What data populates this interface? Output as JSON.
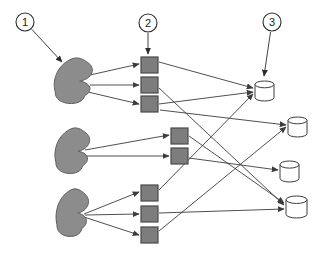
{
  "diagram": {
    "colors": {
      "source_fill": "#8c8c8c",
      "source_stroke": "#5e5e5e",
      "node_fill": "#7d7d7d",
      "node_stroke": "#4a4a4a",
      "store_fill": "#ffffff",
      "store_stroke": "#3c3c3c",
      "arrow": "#3c3c3c",
      "callout_stroke": "#2b2b2b",
      "background": "#ffffff"
    },
    "callouts": [
      {
        "id": "callout-1",
        "label": "1",
        "cx": 25,
        "cy": 22,
        "r": 9,
        "tip_x": 62,
        "tip_y": 62
      },
      {
        "id": "callout-2",
        "label": "2",
        "cx": 148,
        "cy": 23,
        "r": 9,
        "tip_x": 148,
        "tip_y": 54
      },
      {
        "id": "callout-3",
        "label": "3",
        "cx": 272,
        "cy": 22,
        "r": 9,
        "tip_x": 264,
        "tip_y": 76
      }
    ],
    "sources": [
      {
        "id": "source-1",
        "label": "source-blob-1",
        "cx": 73,
        "cy": 82,
        "w": 34,
        "h": 46
      },
      {
        "id": "source-2",
        "label": "source-blob-2",
        "cx": 72,
        "cy": 152,
        "w": 31,
        "h": 46
      },
      {
        "id": "source-3",
        "label": "source-blob-3",
        "cx": 72,
        "cy": 214,
        "w": 29,
        "h": 48
      }
    ],
    "nodes": [
      {
        "id": "node-1",
        "label": "node-1",
        "x": 141,
        "y": 57,
        "w": 17,
        "h": 16,
        "group": 1
      },
      {
        "id": "node-2",
        "label": "node-2",
        "x": 141,
        "y": 77,
        "w": 17,
        "h": 16,
        "group": 1
      },
      {
        "id": "node-3",
        "label": "node-3",
        "x": 141,
        "y": 96,
        "w": 17,
        "h": 16,
        "group": 1
      },
      {
        "id": "node-4",
        "label": "node-4",
        "x": 171,
        "y": 128,
        "w": 17,
        "h": 16,
        "group": 2
      },
      {
        "id": "node-5",
        "label": "node-5",
        "x": 171,
        "y": 148,
        "w": 17,
        "h": 16,
        "group": 2
      },
      {
        "id": "node-6",
        "label": "node-6",
        "x": 141,
        "y": 185,
        "w": 17,
        "h": 16,
        "group": 3
      },
      {
        "id": "node-7",
        "label": "node-7",
        "x": 141,
        "y": 206,
        "w": 17,
        "h": 16,
        "group": 3
      },
      {
        "id": "node-8",
        "label": "node-8",
        "x": 141,
        "y": 227,
        "w": 17,
        "h": 16,
        "group": 3
      }
    ],
    "stores": [
      {
        "id": "store-1",
        "label": "store-1",
        "x": 255,
        "y": 81,
        "w": 19,
        "h": 20
      },
      {
        "id": "store-2",
        "label": "store-2",
        "x": 288,
        "y": 117,
        "w": 19,
        "h": 20
      },
      {
        "id": "store-3",
        "label": "store-3",
        "x": 280,
        "y": 161,
        "w": 19,
        "h": 21
      },
      {
        "id": "store-4",
        "label": "store-4",
        "x": 286,
        "y": 196,
        "w": 21,
        "h": 22
      }
    ],
    "links_source_to_node": [
      {
        "from": "source-1",
        "to": "node-1",
        "x1": 90,
        "y1": 75,
        "x2": 139,
        "y2": 64
      },
      {
        "from": "source-1",
        "to": "node-2",
        "x1": 90,
        "y1": 85,
        "x2": 139,
        "y2": 85
      },
      {
        "from": "source-1",
        "to": "node-3",
        "x1": 88,
        "y1": 92,
        "x2": 139,
        "y2": 104
      },
      {
        "from": "source-2",
        "to": "node-4",
        "x1": 85,
        "y1": 150,
        "x2": 169,
        "y2": 135
      },
      {
        "from": "source-2",
        "to": "node-5",
        "x1": 84,
        "y1": 156,
        "x2": 169,
        "y2": 156
      },
      {
        "from": "source-3",
        "to": "node-6",
        "x1": 84,
        "y1": 214,
        "x2": 139,
        "y2": 192
      },
      {
        "from": "source-3",
        "to": "node-7",
        "x1": 85,
        "y1": 215,
        "x2": 139,
        "y2": 214
      },
      {
        "from": "source-3",
        "to": "node-8",
        "x1": 84,
        "y1": 217,
        "x2": 139,
        "y2": 235
      }
    ],
    "links_node_to_store": [
      {
        "from": "node-1",
        "to": "store-1",
        "x1": 159,
        "y1": 62,
        "x2": 253,
        "y2": 88
      },
      {
        "from": "node-2",
        "to": "store-4",
        "x1": 159,
        "y1": 88,
        "x2": 284,
        "y2": 205
      },
      {
        "from": "node-3",
        "to": "store-1",
        "x1": 159,
        "y1": 104,
        "x2": 253,
        "y2": 92
      },
      {
        "from": "node-4",
        "to": "store-4",
        "x1": 189,
        "y1": 136,
        "x2": 284,
        "y2": 203
      },
      {
        "from": "node-5",
        "to": "store-3",
        "x1": 189,
        "y1": 158,
        "x2": 278,
        "y2": 170
      },
      {
        "from": "node-6",
        "to": "store-1",
        "x1": 159,
        "y1": 190,
        "x2": 253,
        "y2": 94
      },
      {
        "from": "node-7",
        "to": "store-4",
        "x1": 159,
        "y1": 213,
        "x2": 284,
        "y2": 209
      },
      {
        "from": "node-8",
        "to": "store-2",
        "x1": 159,
        "y1": 231,
        "x2": 286,
        "y2": 127
      },
      {
        "from": "node-3",
        "to": "store-2",
        "x1": 160,
        "y1": 110,
        "x2": 286,
        "y2": 125
      }
    ]
  }
}
